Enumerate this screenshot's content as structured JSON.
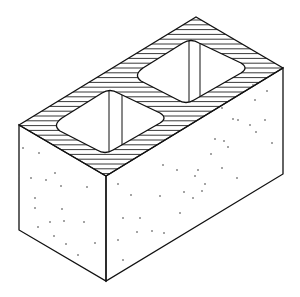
{
  "figure": {
    "colors": {
      "line": "#111111",
      "background": "#ffffff"
    }
  }
}
